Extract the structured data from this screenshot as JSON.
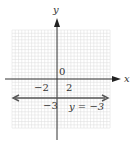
{
  "chart_data": {
    "type": "line",
    "title": "",
    "xlabel": "x",
    "ylabel": "y",
    "origin_label": "0",
    "tick_labels": {
      "x": [
        "-2",
        "2"
      ],
      "y": [
        "-3"
      ]
    },
    "xlim": [
      -7,
      8
    ],
    "ylim": [
      -9,
      8
    ],
    "grid": true,
    "series": [
      {
        "name": "y = -3",
        "equation": "y = -3",
        "type": "horizontal-line",
        "y": -3,
        "x": [
          -7,
          7.5
        ],
        "values": [
          -3,
          -3
        ],
        "arrows": "both"
      }
    ],
    "annotations": [
      {
        "text": "y = −3",
        "x": 3,
        "y": -4
      }
    ]
  },
  "labels": {
    "x_axis": "x",
    "y_axis": "y",
    "origin": "0",
    "x_neg2": "−2",
    "x_pos2": "2",
    "y_neg3": "−3",
    "line_label": "y = −3"
  },
  "colors": {
    "axis": "#333333",
    "line": "#555555",
    "grid": "#dcdcdc",
    "grid_major": "#c8c8c8"
  }
}
